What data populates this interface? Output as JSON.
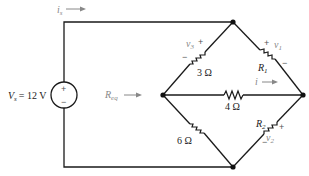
{
  "circuit": {
    "source": {
      "label": "V",
      "sub": "s",
      "value": "= 12 V",
      "plus": "+",
      "minus": "−"
    },
    "source_current": {
      "label": "i",
      "sub": "s"
    },
    "req_label": {
      "label": "R",
      "sub": "eq"
    },
    "branch_current": {
      "label": "i"
    },
    "resistors": [
      {
        "id": "r3",
        "value": "3 Ω",
        "voltage": "v",
        "voltage_sub": "3",
        "plus": "+",
        "minus": "−"
      },
      {
        "id": "r1",
        "name": "R",
        "name_sub": "1",
        "voltage": "v",
        "voltage_sub": "1",
        "plus": "+",
        "minus": "−"
      },
      {
        "id": "r4",
        "value": "4 Ω"
      },
      {
        "id": "r6",
        "value": "6 Ω"
      },
      {
        "id": "r2",
        "name": "R",
        "name_sub": "2",
        "voltage": "v",
        "voltage_sub": "2",
        "plus": "+",
        "minus": "−"
      }
    ]
  }
}
